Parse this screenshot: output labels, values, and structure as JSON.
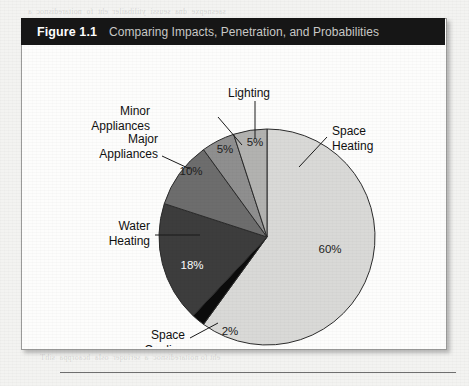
{
  "figure": {
    "number": "Figure 1.1",
    "caption": "Comparing Impacts, Penetration, and Probabilities"
  },
  "colors": {
    "header_background": "#161616",
    "header_number_text": "#ffffff",
    "header_caption_text": "#c9c9c7",
    "box_background": "#fdfdfc",
    "box_border": "#9a9a99",
    "page_background": "#f3f3f1",
    "outline": "#2b2b2b"
  },
  "chart_data": {
    "type": "pie",
    "title": "Comparing Impacts, Penetration, and Probabilities",
    "legend": "none",
    "start_angle_deg": 0,
    "direction": "clockwise",
    "categories": [
      "Space Heating",
      "Space Cooling",
      "Water Heating",
      "Major Appliances",
      "Minor Appliances",
      "Lighting"
    ],
    "values": [
      60,
      2,
      18,
      10,
      5,
      5
    ],
    "value_labels": [
      "60%",
      "2%",
      "18%",
      "10%",
      "5%",
      "5%"
    ],
    "slice_colors": [
      "#d9d9d7",
      "#0b0b0b",
      "#3d3d3d",
      "#6d6d6d",
      "#8f8f8f",
      "#b2b2b0"
    ],
    "slices": [
      {
        "name": "Space Heating",
        "value": 60,
        "value_label": "60%",
        "label_line1": "Space",
        "label_line2": "Heating",
        "color": "#d9d9d7",
        "value_text_color": "#1d1d1d"
      },
      {
        "name": "Space Cooling",
        "value": 2,
        "value_label": "2%",
        "label_line1": "Space",
        "label_line2": "Cooling",
        "color": "#0b0b0b",
        "value_text_color": "#1d1d1d"
      },
      {
        "name": "Water Heating",
        "value": 18,
        "value_label": "18%",
        "label_line1": "Water",
        "label_line2": "Heating",
        "color": "#3d3d3d",
        "value_text_color": "#ffffff"
      },
      {
        "name": "Major Appliances",
        "value": 10,
        "value_label": "10%",
        "label_line1": "Major",
        "label_line2": "Appliances",
        "color": "#6d6d6d",
        "value_text_color": "#1d1d1d"
      },
      {
        "name": "Minor Appliances",
        "value": 5,
        "value_label": "5%",
        "label_line1": "Minor",
        "label_line2": "Appliances",
        "color": "#8f8f8f",
        "value_text_color": "#1d1d1d"
      },
      {
        "name": "Lighting",
        "value": 5,
        "value_label": "5%",
        "label_line1": "Lighting",
        "label_line2": "",
        "color": "#b2b2b0",
        "value_text_color": "#1d1d1d"
      }
    ]
  },
  "bleed_through": {
    "top": "  saesnepxe  dna  seussi  ytilibailer  eht  fo  noitaredisnoc  a",
    "right": "e ot elbapac era dna\nyb yletarucca ,noita\nksat eht ni seitiroirp\nyb denifed era taht\neulav a fo tpecnoc\nserusaem eht fo eno",
    "lower": "dna etairporppa\neht fo gnidnatsrednu\nretaerg etanimile ot\nsti ,snoitcnuf eht",
    "bottom": " eht fo noitaredisnoc  a  seriuqer  osla  hcaorppa  sihT"
  }
}
